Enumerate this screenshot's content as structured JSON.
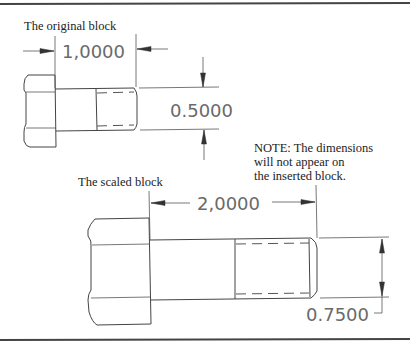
{
  "labels": {
    "original": "The original block",
    "scaled": "The scaled block",
    "note_line1": "NOTE: The dimensions",
    "note_line2": "will not appear on",
    "note_line3": "the inserted block."
  },
  "dimensions": {
    "original_length": "1,0000",
    "original_diameter": "0.5000",
    "scaled_length": "2,0000",
    "scaled_diameter": "0.7500"
  },
  "scale_factor": 2
}
